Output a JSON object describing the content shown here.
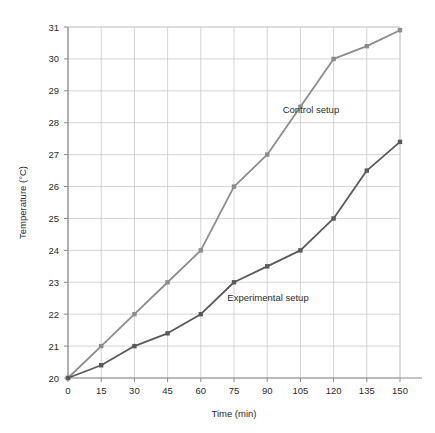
{
  "chart_data": {
    "type": "line",
    "title": "",
    "xlabel": "Time (min)",
    "ylabel": "Temperature (°C)",
    "x": [
      0,
      15,
      30,
      45,
      60,
      75,
      90,
      105,
      120,
      135,
      150
    ],
    "xticklabels": [
      "0",
      "15",
      "30",
      "45",
      "60",
      "75",
      "90",
      "105",
      "120",
      "135",
      "150"
    ],
    "yticks": [
      20,
      21,
      22,
      23,
      24,
      25,
      26,
      27,
      28,
      29,
      30,
      31
    ],
    "yticklabels": [
      "20",
      "21",
      "22",
      "23",
      "24",
      "25",
      "26",
      "27",
      "28",
      "29",
      "30",
      "31"
    ],
    "xlim": [
      0,
      150
    ],
    "ylim": [
      20,
      31
    ],
    "grid": true,
    "legend_position": "inline-annotations",
    "series": [
      {
        "name": "Control setup",
        "color": "#8c8c8c",
        "marker": "square",
        "values": [
          20,
          21,
          22,
          23,
          24,
          26,
          27,
          28.5,
          30,
          30.4,
          30.9
        ]
      },
      {
        "name": "Experimental setup",
        "color": "#595959",
        "marker": "square",
        "values": [
          20,
          20.4,
          21,
          21.4,
          22,
          23,
          23.5,
          24,
          25,
          26.5,
          27.4
        ]
      }
    ],
    "annotations": [
      {
        "text": "Control setup",
        "x": 97,
        "y": 28.3
      },
      {
        "text": "Experimental setup",
        "x": 72,
        "y": 22.4
      }
    ]
  },
  "style": {
    "grid_color": "#c9c9c9",
    "axis_color": "#8a8a8a",
    "text_color": "#2b2b2b",
    "background": "#ffffff"
  }
}
